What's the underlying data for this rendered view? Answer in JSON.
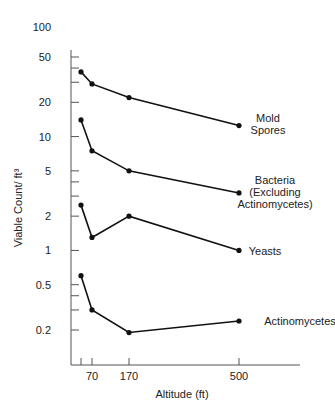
{
  "chart_data": {
    "type": "line",
    "title": "",
    "xlabel": "Altitude (ft)",
    "ylabel": "Viable Count/ ft³",
    "yscale": "log",
    "ylim": [
      0.12,
      100
    ],
    "x_ticks": [
      30,
      70,
      170,
      500
    ],
    "x_tick_labels": [
      "",
      "70",
      "170",
      "500"
    ],
    "y_tick_labels": [
      "100",
      "50",
      "20",
      "10",
      "5",
      "2",
      "1",
      "0.5",
      "0.2"
    ],
    "grid": false,
    "legend": "inline labels at right end of each series",
    "x": [
      30,
      70,
      170,
      500
    ],
    "series": [
      {
        "name": "Mold Spores",
        "label_lines": [
          "Mold",
          "Spores"
        ],
        "values": [
          37,
          29,
          22,
          12.5
        ]
      },
      {
        "name": "Bacteria (Excluding Actinomycetes)",
        "label_lines": [
          "Bacteria",
          "(Excluding",
          "Actinomycetes)"
        ],
        "values": [
          14,
          7.5,
          5,
          3.2
        ]
      },
      {
        "name": "Yeasts",
        "label_lines": [
          "Yeasts"
        ],
        "values": [
          2.5,
          1.3,
          2,
          1
        ]
      },
      {
        "name": "Actinomycetes",
        "label_lines": [
          "Actinomycetes"
        ],
        "values": [
          0.6,
          0.3,
          0.19,
          0.24
        ]
      }
    ]
  },
  "colors": {
    "line": "#111111",
    "axis": "#555555",
    "text": "#222222"
  }
}
